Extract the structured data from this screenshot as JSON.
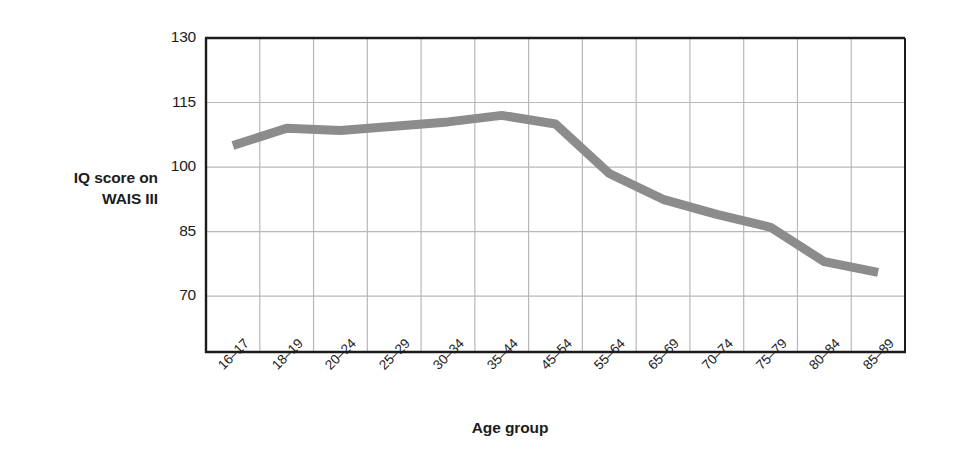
{
  "chart_data": {
    "type": "line",
    "title": "",
    "xlabel": "Age group",
    "ylabel": "IQ score on WAIS III",
    "ylabel_lines": [
      "IQ score on",
      "WAIS III"
    ],
    "categories": [
      "16–17",
      "18–19",
      "20–24",
      "25–29",
      "30–34",
      "35–44",
      "45–54",
      "55–64",
      "65–69",
      "70–74",
      "75–79",
      "80–84",
      "85–89"
    ],
    "values": [
      105,
      109,
      108.5,
      109.5,
      110.5,
      112,
      110,
      98.5,
      92.5,
      89,
      86,
      78,
      75.5
    ],
    "series": [
      {
        "name": "IQ score on WAIS III",
        "values": [
          105,
          109,
          108.5,
          109.5,
          110.5,
          112,
          110,
          98.5,
          92.5,
          89,
          86,
          78,
          75.5
        ],
        "color": "#8c8c8c"
      }
    ],
    "ytick_labels": [
      "70",
      "85",
      "100",
      "115",
      "130"
    ],
    "yticks": [
      70,
      85,
      100,
      115,
      130
    ],
    "ylim": [
      57,
      130
    ],
    "grid": true,
    "grid_color": "#b8b8b8",
    "axis_color": "#1c1c1c",
    "legend": "none",
    "line_width_px": 9
  },
  "colors": {
    "background": "#ffffff",
    "line": "#8c8c8c",
    "axis": "#1c1c1c",
    "grid": "#b8b8b8",
    "text": "#1c1c1c"
  }
}
